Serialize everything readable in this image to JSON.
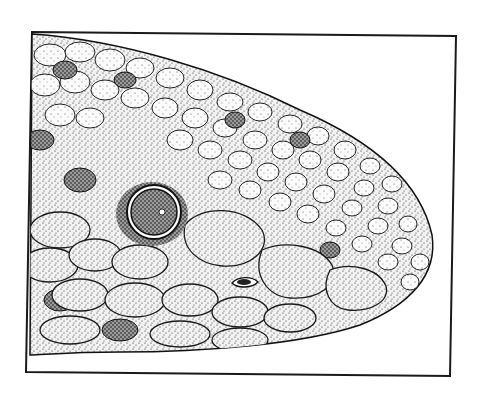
{
  "image": {
    "subject": "stippled illustration of a reptile head (scaled snout, eye, nostril) in a rectangular frame",
    "style": "black ink stipple on white",
    "colors": {
      "background": "#ffffff",
      "ink": "#111111",
      "scale_fill": "#e9e9e9",
      "scale_dark": "#8a8a8a",
      "frame": "#1a1a1a"
    }
  }
}
